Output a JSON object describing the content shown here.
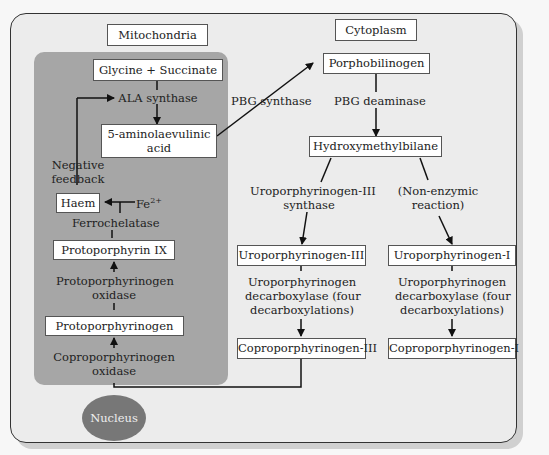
{
  "compartments": {
    "mitochondria": "Mitochondria",
    "cytoplasm": "Cytoplasm",
    "nucleus": "Nucleus"
  },
  "nodes": {
    "glycine_succinate": "Glycine + Succinate",
    "ala_line1": "5-aminolaevulinic",
    "ala_line2": "acid",
    "haem": "Haem",
    "protoporphyrin_ix": "Protoporphyrin IX",
    "protoporphyrinogen": "Protoporphyrinogen",
    "porphobilinogen": "Porphobilinogen",
    "hydroxymethylbilane": "Hydroxymethylbilane",
    "uroporphyrinogen_iii": "Uroporphyrinogen-III",
    "uroporphyrinogen_i": "Uroporphyrinogen-I",
    "coproporphyrinogen_iii": "Coproporphyrinogen-III",
    "coproporphyrinogen_i": "Coproporphyrinogen-I"
  },
  "labels": {
    "ala_synthase": "ALA synthase",
    "negative_feedback_1": "Negative",
    "negative_feedback_2": "feedback",
    "fe": "Fe",
    "fe_charge": "2+",
    "ferrochelatase": "Ferrochelatase",
    "protox_1": "Protoporphyrinogen",
    "protox_2": "oxidase",
    "coprox_1": "Coproporphyrinogen",
    "coprox_2": "oxidase",
    "pbg_synthase": "PBG synthase",
    "pbg_deaminase": "PBG deaminase",
    "uro3_synthase_1": "Uroporphyrinogen-III",
    "uro3_synthase_2": "synthase",
    "nonenz_1": "(Non-enzymic",
    "nonenz_2": "reaction)",
    "urod_a_1": "Uroporphyrinogen",
    "urod_a_2": "decarboxylase (four",
    "urod_a_3": "decarboxylations)",
    "urod_b_1": "Uroporphyrinogen",
    "urod_b_2": "decarboxylase (four",
    "urod_b_3": "decarboxylations)"
  },
  "colors": {
    "outer_bg": "#ececec",
    "mitochondria_bg": "#a6a6a6",
    "nucleus_bg": "#777777",
    "box_bg": "#ffffff"
  }
}
